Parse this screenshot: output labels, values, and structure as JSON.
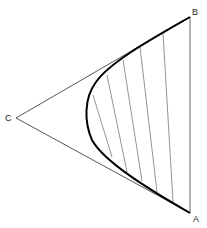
{
  "diagram": {
    "points": {
      "A": {
        "label": "A",
        "x": 190,
        "y": 213
      },
      "B": {
        "label": "B",
        "x": 190,
        "y": 17
      },
      "C": {
        "label": "C",
        "x": 16,
        "y": 118
      }
    },
    "edges": [
      {
        "from": "C",
        "to": "B"
      },
      {
        "from": "C",
        "to": "A"
      },
      {
        "from": "B",
        "to": "A"
      }
    ],
    "curve": {
      "type": "parabola",
      "from": "B",
      "to": "A",
      "vertex_x": 85,
      "vertex_y": 113
    },
    "hatch_lines": [
      {
        "x1": 93,
        "y1": 95,
        "x2": 112,
        "y2": 157
      },
      {
        "x1": 107,
        "y1": 75,
        "x2": 127,
        "y2": 172
      },
      {
        "x1": 123,
        "y1": 60,
        "x2": 142,
        "y2": 181
      },
      {
        "x1": 140,
        "y1": 47,
        "x2": 157,
        "y2": 192
      },
      {
        "x1": 163,
        "y1": 33,
        "x2": 173,
        "y2": 202
      }
    ],
    "colors": {
      "line": "#444444",
      "curve": "#000000",
      "hatch": "#666666"
    }
  }
}
